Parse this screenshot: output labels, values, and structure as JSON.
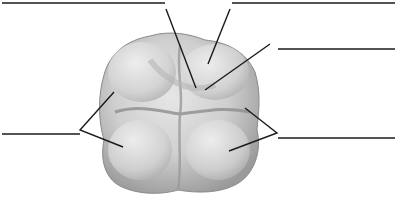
{
  "diagram": {
    "colors": {
      "line": "#1a1a1a",
      "tooth_light": "#e9e9e9",
      "tooth_mid": "#c4c4c4",
      "tooth_dark": "#8f8f8f"
    },
    "labels": [
      {
        "id": "label-top-left",
        "text": ""
      },
      {
        "id": "label-top-right",
        "text": ""
      },
      {
        "id": "label-right-upper",
        "text": ""
      },
      {
        "id": "label-left",
        "text": ""
      },
      {
        "id": "label-right-lower",
        "text": ""
      }
    ]
  }
}
